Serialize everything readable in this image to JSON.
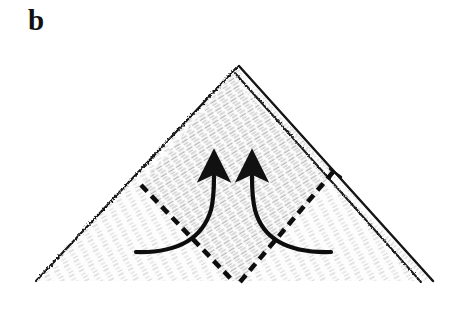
{
  "figure": {
    "panel_label": "b",
    "caption_text": "",
    "background_color": "#ffffff",
    "ink_color": "#111111",
    "paper_fill_color": "#fbfbfb",
    "texture_color": "#9a9a9a",
    "type": "origami-fold-diagram"
  },
  "shapes": {
    "outer_triangle": {
      "name": "paper-triangle",
      "apex": [
        237,
        67
      ],
      "bottom_left": [
        36,
        281
      ],
      "bottom_right": [
        432,
        281
      ],
      "stroke_color": "#111111",
      "stroke_width": 2,
      "fill": "#fbfbfb"
    },
    "fold_flap": {
      "name": "right-edge-flap",
      "from": [
        238,
        71
      ],
      "to": [
        429,
        279
      ],
      "widen_px": 9,
      "stroke_color": "#111111",
      "stroke_width": 2
    },
    "dashed_fold_left": {
      "name": "left-fold-crease",
      "from": [
        141,
        185
      ],
      "to": [
        234,
        282
      ],
      "dash": "9 6",
      "stroke_color": "#111111",
      "stroke_width": 4.5
    },
    "dashed_fold_right": {
      "name": "right-fold-crease",
      "from": [
        333,
        172
      ],
      "to": [
        240,
        282
      ],
      "dash": "9 6",
      "stroke_color": "#111111",
      "stroke_width": 4.5
    },
    "arrow_left": {
      "name": "left-fold-arrow",
      "tail": [
        136,
        252
      ],
      "tip": [
        214,
        166
      ],
      "direction": "up",
      "stroke_color": "#111111",
      "stroke_width": 4
    },
    "arrow_right": {
      "name": "right-fold-arrow",
      "tail": [
        331,
        252
      ],
      "tip": [
        253,
        166
      ],
      "direction": "up",
      "stroke_color": "#111111",
      "stroke_width": 4
    }
  }
}
